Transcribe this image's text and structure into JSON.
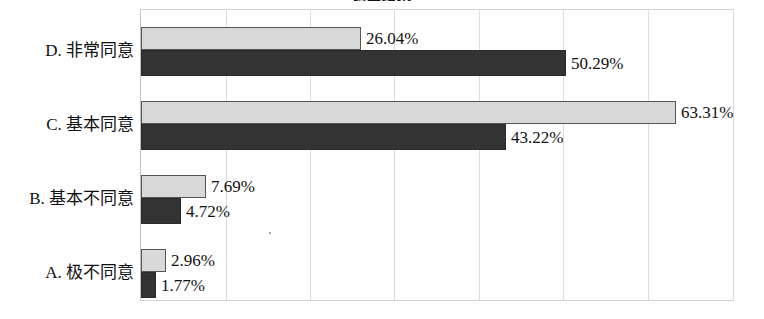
{
  "chart_data": {
    "type": "bar",
    "orientation": "horizontal",
    "title": "调查结果",
    "xlabel": "",
    "ylabel": "",
    "xlim": [
      0,
      70
    ],
    "grid": true,
    "gridline_step_percent": 10,
    "legend_position": "none",
    "value_suffix": "%",
    "categories": [
      "D. 非常同意",
      "C. 基本同意",
      "B. 基本不同意",
      "A. 极不同意"
    ],
    "series": [
      {
        "name": "series-light",
        "color": "#d9d9d9",
        "values": [
          26.04,
          63.31,
          7.69,
          2.96
        ],
        "labels": [
          "26.04%",
          "63.31%",
          "7.69%",
          "2.96%"
        ]
      },
      {
        "name": "series-dark",
        "color": "#333333",
        "values": [
          50.29,
          43.22,
          4.72,
          1.77
        ],
        "labels": [
          "50.29%",
          "43.22%",
          "4.72%",
          "1.77%"
        ]
      }
    ]
  },
  "colors": {
    "series_light": "#d9d9d9",
    "series_dark": "#333333",
    "gridline": "#dcdcdc",
    "plot_border": "#d2d2d2",
    "text": "#111111",
    "background": "#ffffff"
  },
  "axis": {
    "gridline_percents": [
      0,
      10,
      20,
      30,
      40,
      50,
      60,
      70
    ],
    "tick_labels": []
  },
  "rows": [
    {
      "label": "D. 非常同意",
      "light_label": "26.04%",
      "dark_label": "50.29%",
      "light_value": 26.04,
      "dark_value": 50.29
    },
    {
      "label": "C. 基本同意",
      "light_label": "63.31%",
      "dark_label": "43.22%",
      "light_value": 63.31,
      "dark_value": 43.22
    },
    {
      "label": "B. 基本不同意",
      "light_label": "7.69%",
      "dark_label": "4.72%",
      "light_value": 7.69,
      "dark_value": 4.72
    },
    {
      "label": "A. 极不同意",
      "light_label": "2.96%",
      "dark_label": "1.77%",
      "light_value": 2.96,
      "dark_value": 1.77
    }
  ]
}
